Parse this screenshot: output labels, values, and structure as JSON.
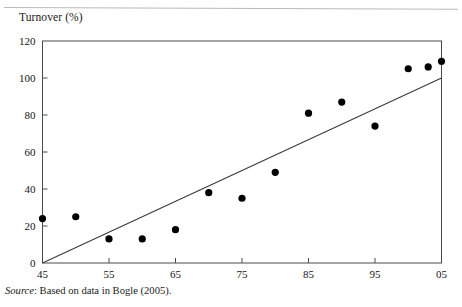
{
  "figure": {
    "y_axis_title": "Turnover (%)",
    "source_prefix": "Source",
    "source_text": ": Based on data in Bogle (2005)."
  },
  "chart_data": {
    "type": "scatter",
    "title": "",
    "xlabel": "",
    "ylabel": "Turnover (%)",
    "xlim": [
      45,
      105
    ],
    "ylim": [
      0,
      120
    ],
    "grid": false,
    "legend": null,
    "xticks": [
      45,
      55,
      65,
      75,
      85,
      95,
      105
    ],
    "xtick_labels": [
      "45",
      "55",
      "65",
      "75",
      "85",
      "95",
      "05"
    ],
    "yticks": [
      0,
      20,
      40,
      60,
      80,
      100,
      120
    ],
    "ytick_labels": [
      "0",
      "20",
      "40",
      "60",
      "80",
      "100",
      "120"
    ],
    "series": [
      {
        "name": "Turnover",
        "type": "scatter",
        "marker": "filled-circle",
        "color": "#000000",
        "points": [
          {
            "x": 45,
            "y": 24
          },
          {
            "x": 50,
            "y": 25
          },
          {
            "x": 55,
            "y": 13
          },
          {
            "x": 60,
            "y": 13
          },
          {
            "x": 65,
            "y": 18
          },
          {
            "x": 70,
            "y": 38
          },
          {
            "x": 75,
            "y": 35
          },
          {
            "x": 80,
            "y": 49
          },
          {
            "x": 85,
            "y": 81
          },
          {
            "x": 90,
            "y": 87
          },
          {
            "x": 95,
            "y": 74
          },
          {
            "x": 100,
            "y": 105
          },
          {
            "x": 103,
            "y": 106
          },
          {
            "x": 105,
            "y": 109
          }
        ]
      },
      {
        "name": "Trend line",
        "type": "line",
        "color": "#3a3a3a",
        "points": [
          {
            "x": 45,
            "y": 0
          },
          {
            "x": 105,
            "y": 100
          }
        ]
      }
    ]
  }
}
